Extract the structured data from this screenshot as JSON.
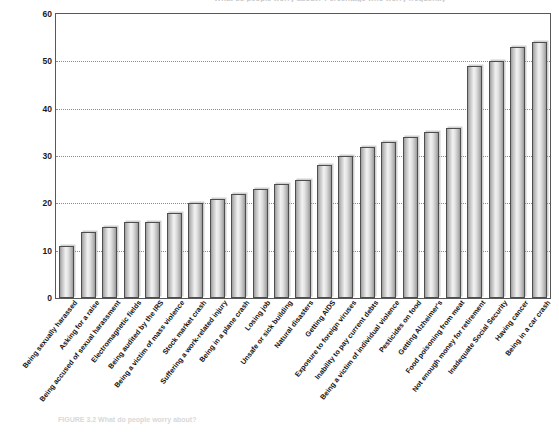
{
  "figure": {
    "title": "What do people worry about? Percentage who worry frequently",
    "caption_label": "FIGURE 3.2",
    "caption_text": "What do people worry about?"
  },
  "chart_data": {
    "type": "bar",
    "title": "What do people worry about? Percentage who worry frequently",
    "xlabel": "",
    "ylabel": "",
    "ylim": [
      0,
      60
    ],
    "yticks": [
      0,
      10,
      20,
      30,
      40,
      50,
      60
    ],
    "grid": true,
    "legend": "none",
    "categories": [
      "Being sexually harassed",
      "Asking for a raise",
      "Being accused of sexual harassment",
      "Electromagnetic fields",
      "Being audited by the IRS",
      "Being a victim of mass violence",
      "Stock market crash",
      "Suffering a work-related injury",
      "Being in a plane crash",
      "Losing job",
      "Unsafe or sick building",
      "Natural disasters",
      "Getting AIDS",
      "Exposure to foreign viruses",
      "Inability to pay current debts",
      "Being a victim of individual violence",
      "Pesticides on food",
      "Getting Alzheimer's",
      "Food poisoning from meat",
      "Not enough money for retirement",
      "Inadequate Social Security",
      "Having cancer",
      "Being in a car crash"
    ],
    "values": [
      11,
      14,
      15,
      16,
      16,
      18,
      20,
      21,
      22,
      23,
      24,
      25,
      28,
      30,
      32,
      33,
      34,
      35,
      36,
      49,
      50,
      53,
      54
    ]
  }
}
